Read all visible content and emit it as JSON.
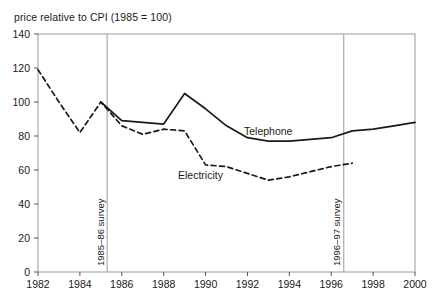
{
  "chart_data": {
    "type": "line",
    "title": "price relative to CPI (1985 = 100)",
    "xlabel": "",
    "ylabel": "",
    "xlim": [
      1982,
      2000
    ],
    "ylim": [
      0,
      140
    ],
    "grid": false,
    "legend_position": "inline-labels",
    "xticks": [
      1982,
      1984,
      1986,
      1988,
      1990,
      1992,
      1994,
      1996,
      1998,
      2000
    ],
    "yticks": [
      0,
      20,
      40,
      60,
      80,
      100,
      120,
      140
    ],
    "series": [
      {
        "name": "Telephone",
        "style": "solid",
        "color": "#1a1a1a",
        "x": [
          1985,
          1986,
          1987,
          1988,
          1989,
          1990,
          1991,
          1992,
          1993,
          1994,
          1995,
          1996,
          1997,
          1998,
          1999,
          2000
        ],
        "values": [
          100,
          89,
          88,
          87,
          105,
          96,
          86,
          79,
          77,
          77,
          78,
          79,
          83,
          84,
          86,
          88
        ]
      },
      {
        "name": "Electricity",
        "style": "dashed",
        "color": "#1a1a1a",
        "x": [
          1982,
          1983,
          1984,
          1985,
          1986,
          1987,
          1988,
          1989,
          1990,
          1991,
          1992,
          1993,
          1994,
          1995,
          1996,
          1997
        ],
        "values": [
          119,
          100,
          82,
          100,
          86,
          81,
          84,
          83,
          63,
          62,
          58,
          54,
          56,
          59,
          62,
          64
        ]
      }
    ],
    "annotations": [
      {
        "label": "1985–86 survey",
        "x": 1985.3,
        "orientation": "vertical-line"
      },
      {
        "label": "1996–97 survey",
        "x": 1996.6,
        "orientation": "vertical-line"
      }
    ]
  }
}
